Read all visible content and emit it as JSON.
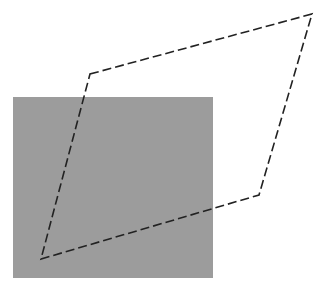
{
  "canvas": {
    "width": 325,
    "height": 297,
    "background": "#ffffff"
  },
  "shapes": {
    "rectangle": {
      "x": 13,
      "y": 97,
      "width": 200,
      "height": 181,
      "fill": "#9c9c9c"
    },
    "parallelogram": {
      "points": [
        [
          90,
          74
        ],
        [
          312,
          14
        ],
        [
          259,
          195
        ],
        [
          41,
          259
        ]
      ],
      "stroke": "#222222",
      "stroke_width": 1.6,
      "dash": "9,4"
    }
  }
}
